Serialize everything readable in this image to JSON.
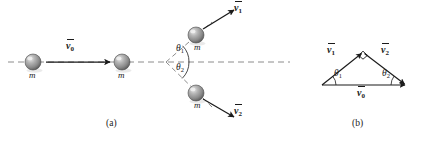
{
  "figure": {
    "background_color": "#ffffff",
    "stroke_color": "#1a1a1a",
    "dash_color": "#8c8c8c",
    "sphere_color": "#8f8f8f",
    "panels": [
      {
        "id": "a",
        "caption": "(a)",
        "caption_x": 112,
        "caption_y": 124
      },
      {
        "id": "b",
        "caption": "(b)",
        "caption_x": 358,
        "caption_y": 124
      }
    ],
    "panel_a": {
      "description": "Elastic collision of two equal masses: incoming mass with velocity v0 strikes a stationary mass; after collision the two masses move off at angles theta1 above and theta2 below the original line of motion with velocities v1 and v2.",
      "axis_line": {
        "x1": 8,
        "y1": 62,
        "x2": 290,
        "y2": 62
      },
      "vertex": {
        "x": 166,
        "y": 62
      },
      "spheres": [
        {
          "name": "incoming-mass",
          "cx": 33,
          "cy": 62,
          "r": 8,
          "label": "m",
          "label_x": 33,
          "label_y": 76
        },
        {
          "name": "target-mass",
          "cx": 122,
          "cy": 62,
          "r": 8,
          "label": "m",
          "label_x": 122,
          "label_y": 76
        },
        {
          "name": "scattered-mass-upper",
          "cx": 196,
          "cy": 35,
          "r": 8,
          "label": "m",
          "label_x": 198,
          "label_y": 48
        },
        {
          "name": "scattered-mass-lower",
          "cx": 196,
          "cy": 93,
          "r": 8,
          "label": "m",
          "label_x": 198,
          "label_y": 108
        }
      ],
      "vectors": [
        {
          "name": "v0",
          "label": "v",
          "sub": "0",
          "x1": 46,
          "y1": 62,
          "x2": 110,
          "y2": 62,
          "label_x": 72,
          "label_y": 48
        },
        {
          "name": "v1",
          "label": "v",
          "sub": "1",
          "x1": 203,
          "y1": 29,
          "x2": 235,
          "y2": 9,
          "label_x": 240,
          "label_y": 9
        },
        {
          "name": "v2",
          "label": "v",
          "sub": "2",
          "x1": 203,
          "y1": 99,
          "x2": 235,
          "y2": 117,
          "label_x": 239,
          "label_y": 112
        }
      ],
      "angles": [
        {
          "name": "theta1",
          "label": "θ",
          "sub": "1",
          "label_x": 179,
          "label_y": 50
        },
        {
          "name": "theta2",
          "label": "θ",
          "sub": "2",
          "label_x": 179,
          "label_y": 66
        }
      ]
    },
    "panel_b": {
      "description": "Vector triangle showing v0 as the resultant of v1 and v2 meeting at a right angle, with base angles theta1 and theta2.",
      "triangle": {
        "left_vertex": {
          "x": 322,
          "y": 85
        },
        "apex": {
          "x": 363,
          "y": 52
        },
        "right_vertex": {
          "x": 406,
          "y": 85
        }
      },
      "right_angle_marker": {
        "x": 363,
        "y": 52,
        "size": 6
      },
      "vectors": [
        {
          "name": "v1",
          "label": "v",
          "sub": "1",
          "label_x": 332,
          "label_y": 52
        },
        {
          "name": "v2",
          "label": "v",
          "sub": "2",
          "label_x": 385,
          "label_y": 52
        },
        {
          "name": "v0",
          "label": "v",
          "sub": "0",
          "label_x": 358,
          "label_y": 91
        }
      ],
      "angles": [
        {
          "name": "theta1",
          "label": "θ",
          "sub": "1",
          "label_x": 336,
          "label_y": 74
        },
        {
          "name": "theta2",
          "label": "θ",
          "sub": "2",
          "label_x": 388,
          "label_y": 74
        }
      ]
    }
  }
}
